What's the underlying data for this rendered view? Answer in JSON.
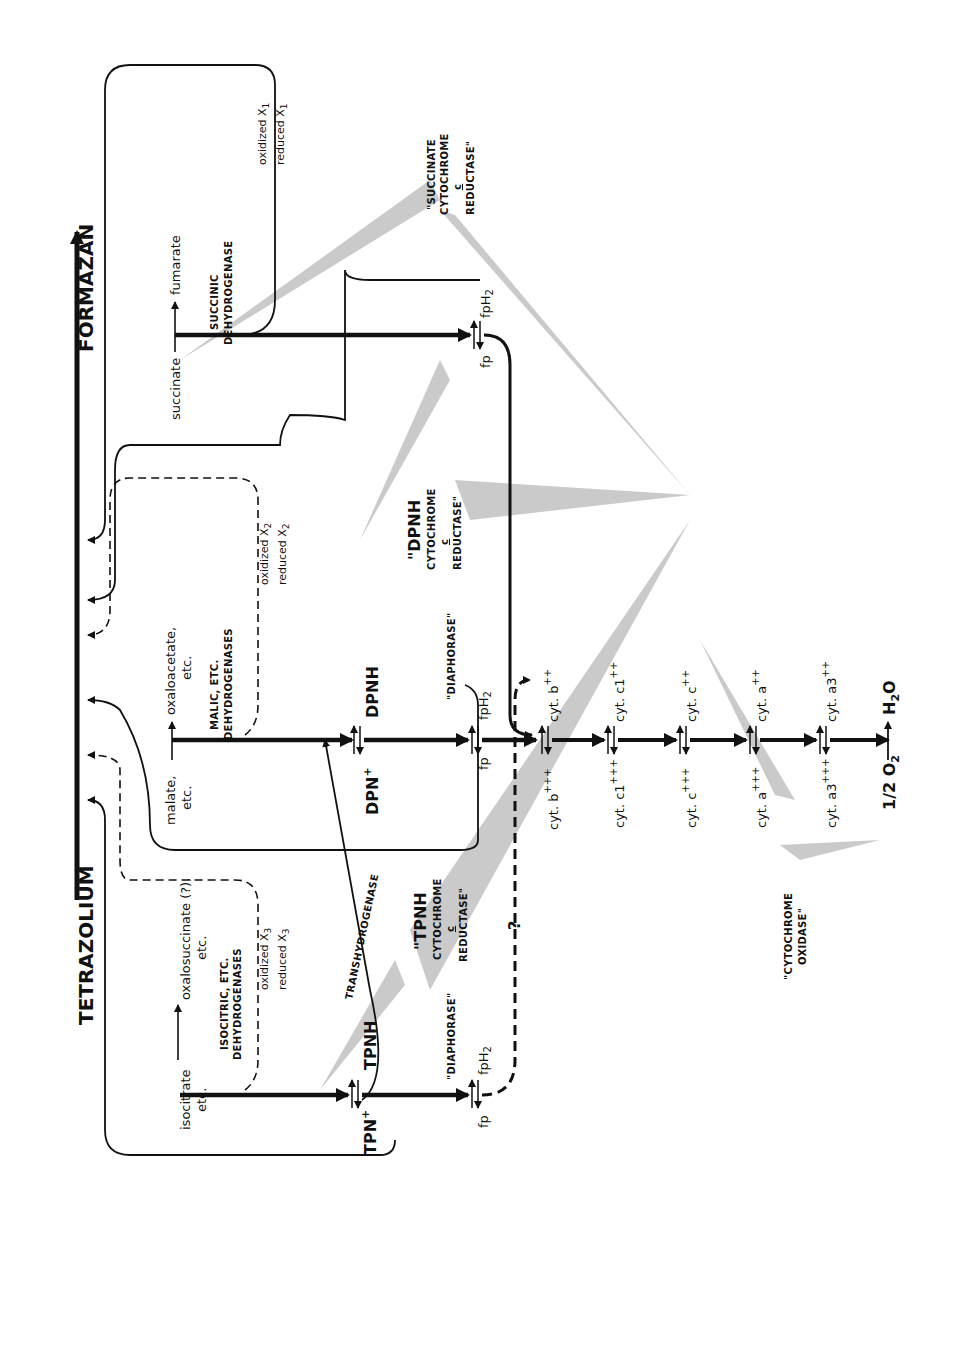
{
  "diagram": {
    "orientation": "rotated 90 degrees clockwise (text reads bottom-to-top)",
    "dye": {
      "oxidized": "TETRAZOLIUM",
      "reduced": "FORMAZAN"
    },
    "pathways": {
      "isocitrate": {
        "substrate": "isocitrate",
        "substrate_etc": "etc.",
        "product": "oxalosuccinate (?),",
        "product_etc": "etc.",
        "enzyme_line1": "ISOCITRIC, ETC.",
        "enzyme_line2": "DEHYDROGENASES",
        "carrier_ox": "oxidized X",
        "carrier_red": "reduced X",
        "carrier_sub": "3",
        "coenzyme_ox": "TPN",
        "coenzyme_ox_sup": "+",
        "coenzyme_red": "TPNH",
        "flavo_label": "\"DIAPHORASE\"",
        "fp": "fp",
        "fpH2": "fpH",
        "fpH2_sub": "2"
      },
      "malate": {
        "substrate": "malate,",
        "substrate_etc": "etc.",
        "product": "oxaloacetate,",
        "product_etc": "etc.",
        "enzyme_line1": "MALIC, ETC.",
        "enzyme_line2": "DEHYDROGENASES",
        "carrier_ox": "oxidized X",
        "carrier_red": "reduced X",
        "carrier_sub": "2",
        "coenzyme_ox": "DPN",
        "coenzyme_ox_sup": "+",
        "coenzyme_red": "DPNH",
        "flavo_label": "\"DIAPHORASE\"",
        "fp": "fp",
        "fpH2": "fpH",
        "fpH2_sub": "2"
      },
      "succinate": {
        "substrate": "succinate",
        "product": "fumarate",
        "enzyme_line1": "SUCCINIC",
        "enzyme_line2": "DEHYDROGENASE",
        "carrier_ox": "oxidized X",
        "carrier_red": "reduced X",
        "carrier_sub": "1",
        "fp": "fp",
        "fpH2": "fpH",
        "fpH2_sub": "2"
      }
    },
    "transhydrogenase": "TRANSHYDROGENASE",
    "unknown_link": "?",
    "enzyme_complexes": {
      "tpnh_reductase": {
        "line1": "\"TPNH",
        "line2": "CYTOCHROME",
        "line3": "c",
        "line4": "REDUCTASE\""
      },
      "dpnh_reductase": {
        "line1": "\"DPNH",
        "line2": "CYTOCHROME",
        "line3": "c",
        "line4": "REDUCTASE\""
      },
      "succinate_reductase": {
        "line1": "\"SUCCINATE",
        "line2": "CYTOCHROME",
        "line3": "c",
        "line4": "REDUCTASE\""
      },
      "cytochrome_oxidase": {
        "line1": "\"CYTOCHROME",
        "line2": "OXIDASE\""
      }
    },
    "cytochromes": [
      {
        "ox": "cyt. b",
        "ox_sup": "+++",
        "red": "cyt. b",
        "red_sup": "++"
      },
      {
        "ox": "cyt. c1",
        "ox_sup": "+++",
        "red": "cyt. c1",
        "red_sup": "++"
      },
      {
        "ox": "cyt. c",
        "ox_sup": "+++",
        "red": "cyt. c",
        "red_sup": "++"
      },
      {
        "ox": "cyt. a",
        "ox_sup": "+++",
        "red": "cyt. a",
        "red_sup": "++"
      },
      {
        "ox": "cyt. a3",
        "ox_sup": "+++",
        "red": "cyt. a3",
        "red_sup": "++"
      }
    ],
    "terminal": {
      "oxygen": "1/2 O",
      "oxygen_sub": "2",
      "water": "H",
      "water_sub": "2",
      "water_o": "O"
    }
  }
}
